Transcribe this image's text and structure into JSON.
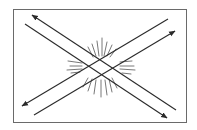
{
  "diagram": {
    "type": "crossing-parallel-lines",
    "colors": {
      "background": "#ffffff",
      "stroke": "#2a2a2a",
      "burst": "#555555"
    },
    "frame": {
      "x": 13,
      "y": 9,
      "width": 173,
      "height": 113
    },
    "lines": [
      {
        "id": "line-a",
        "x1": 32,
        "y1": 15,
        "x2": 176,
        "y2": 110,
        "arrow_at": "start"
      },
      {
        "id": "line-b",
        "x1": 25,
        "y1": 24,
        "x2": 167,
        "y2": 118,
        "arrow_at": "end"
      },
      {
        "id": "line-c",
        "x1": 22,
        "y1": 106,
        "x2": 168,
        "y2": 19,
        "arrow_at": "start"
      },
      {
        "id": "line-d",
        "x1": 34,
        "y1": 115,
        "x2": 175,
        "y2": 31,
        "arrow_at": "end"
      }
    ],
    "burst_center": {
      "x": 100,
      "y": 67
    }
  }
}
